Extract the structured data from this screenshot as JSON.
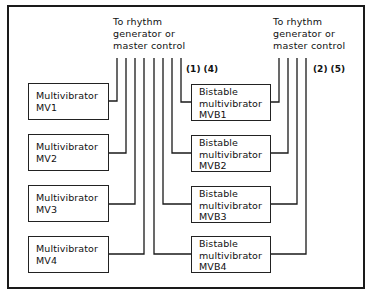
{
  "diagram": {
    "type": "block-diagram",
    "left_bus": {
      "label": [
        "To rhythm",
        "generator or",
        "master control"
      ],
      "note": "(1) (4)"
    },
    "right_bus": {
      "label": [
        "To rhythm",
        "generator or",
        "master control"
      ],
      "note": "(2) (5)"
    },
    "multivibrators": [
      {
        "line1": "Multivibrator",
        "line2": "MV1"
      },
      {
        "line1": "Multivibrator",
        "line2": "MV2"
      },
      {
        "line1": "Multivibrator",
        "line2": "MV3"
      },
      {
        "line1": "Multivibrator",
        "line2": "MV4"
      }
    ],
    "bistables": [
      {
        "line1": "Bistable",
        "line2": "multivibrator",
        "line3": "MVB1"
      },
      {
        "line1": "Bistable",
        "line2": "multivibrator",
        "line3": "MVB2"
      },
      {
        "line1": "Bistable",
        "line2": "multivibrator",
        "line3": "MVB3"
      },
      {
        "line1": "Bistable",
        "line2": "multivibrator",
        "line3": "MVB4"
      }
    ],
    "connections": [
      {
        "from": "MV1",
        "to": "left_bus"
      },
      {
        "from": "MV2",
        "to": "left_bus"
      },
      {
        "from": "MV3",
        "to": "left_bus"
      },
      {
        "from": "MV4",
        "to": "left_bus"
      },
      {
        "from": "MVB1",
        "to": "left_bus"
      },
      {
        "from": "MVB2",
        "to": "left_bus"
      },
      {
        "from": "MVB3",
        "to": "left_bus"
      },
      {
        "from": "MVB4",
        "to": "left_bus"
      },
      {
        "from": "MVB1",
        "to": "right_bus"
      },
      {
        "from": "MVB2",
        "to": "right_bus"
      },
      {
        "from": "MVB3",
        "to": "right_bus"
      },
      {
        "from": "MVB4",
        "to": "right_bus"
      }
    ]
  }
}
